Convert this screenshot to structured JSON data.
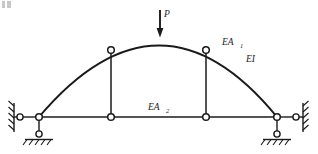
{
  "figure": {
    "background_color": "#ffffff",
    "line_color": "#1a1a1a",
    "labels": {
      "load": "P",
      "arch_axial": "EA",
      "arch_axial_sub": "1",
      "arch_flexural": "EI",
      "tie_axial": "EA",
      "tie_axial_sub": "2"
    },
    "geometry": {
      "arch_left_springing": [
        39,
        117
      ],
      "arch_right_springing": [
        277,
        117
      ],
      "arch_apex": [
        160,
        36
      ],
      "arch_rise": 81,
      "arch_span": 238,
      "tie_level_y": 117,
      "left_hanger_x": 111,
      "right_hanger_x": 206,
      "left_hanger_top_y": 50,
      "right_hanger_top_y": 50,
      "load_arrow_x": 160,
      "load_arrow_top_y": 10,
      "load_arrow_tip_y": 36
    },
    "nodes": [
      {
        "name": "hinge-arch-left-springing",
        "x": 39,
        "y": 117
      },
      {
        "name": "hinge-arch-right-springing",
        "x": 277,
        "y": 117
      },
      {
        "name": "hinge-arch-left-hanger-top",
        "x": 111,
        "y": 50
      },
      {
        "name": "hinge-arch-right-hanger-top",
        "x": 206,
        "y": 50
      },
      {
        "name": "hinge-tie-left-hanger-bottom",
        "x": 111,
        "y": 117
      },
      {
        "name": "hinge-tie-right-hanger-bottom",
        "x": 206,
        "y": 117
      },
      {
        "name": "hinge-left-wall-link",
        "x": 21,
        "y": 117
      },
      {
        "name": "hinge-right-wall-link",
        "x": 296,
        "y": 117
      },
      {
        "name": "hinge-left-ground-link",
        "x": 39,
        "y": 136
      },
      {
        "name": "hinge-right-ground-link",
        "x": 277,
        "y": 136
      }
    ],
    "supports": {
      "left": {
        "type": "horizontal-link-to-wall-plus-vertical-link-to-ground",
        "wall_x": 14,
        "ground_y": 140
      },
      "right": {
        "type": "horizontal-link-to-wall-plus-vertical-link-to-ground",
        "wall_x": 303,
        "ground_y": 140
      }
    }
  }
}
